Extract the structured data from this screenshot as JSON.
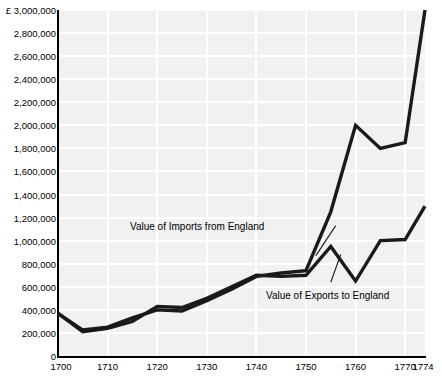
{
  "chart_data": {
    "type": "line",
    "title": "",
    "xlabel": "",
    "ylabel": "",
    "currency_symbol": "£",
    "grid": true,
    "legend_position": "inline-annotations",
    "xlim": [
      1700,
      1774
    ],
    "ylim": [
      0,
      3000000
    ],
    "y_ticks": [
      0,
      200000,
      400000,
      600000,
      800000,
      1000000,
      1200000,
      1400000,
      1600000,
      1800000,
      2000000,
      2200000,
      2400000,
      2600000,
      2800000,
      3000000
    ],
    "y_tick_labels": [
      "0",
      "200,000",
      "400,000",
      "600,000",
      "800,000",
      "1,000,000",
      "1,200,000",
      "1,400,000",
      "1,600,000",
      "1,800,000",
      "2,000,000",
      "2,200,000",
      "2,400,000",
      "2,600,000",
      "2,800,000",
      "£ 3,000,000"
    ],
    "x_ticks": [
      1700,
      1710,
      1720,
      1730,
      1740,
      1750,
      1760,
      1770,
      1774
    ],
    "x_tick_labels": [
      "1700",
      "1710",
      "1720",
      "1730",
      "1740",
      "1750",
      "1760",
      "1770",
      "1774"
    ],
    "series": [
      {
        "name": "Value of Imports from England",
        "color": "#1a1a1a",
        "x": [
          1700,
          1705,
          1710,
          1715,
          1720,
          1725,
          1730,
          1735,
          1740,
          1745,
          1750,
          1755,
          1760,
          1765,
          1770,
          1774
        ],
        "values": [
          370000,
          225000,
          250000,
          330000,
          400000,
          390000,
          480000,
          580000,
          690000,
          720000,
          740000,
          1250000,
          2000000,
          1800000,
          1850000,
          3000000
        ]
      },
      {
        "name": "Value of Exports to England",
        "color": "#1a1a1a",
        "x": [
          1700,
          1705,
          1710,
          1715,
          1720,
          1725,
          1730,
          1735,
          1740,
          1745,
          1750,
          1755,
          1760,
          1765,
          1770,
          1774
        ],
        "values": [
          370000,
          210000,
          240000,
          300000,
          430000,
          420000,
          500000,
          600000,
          700000,
          690000,
          700000,
          950000,
          650000,
          1000000,
          1010000,
          1300000
        ]
      }
    ],
    "annotations": [
      {
        "label": "Value of Imports from England",
        "name": "annotation-imports",
        "leader_from": [
          1752,
          870000
        ],
        "leader_to": [
          1756,
          1130000
        ]
      },
      {
        "label": "Value of Exports to England",
        "name": "annotation-exports",
        "leader_from": [
          1755,
          640000
        ],
        "leader_to": [
          1757,
          880000
        ]
      }
    ]
  }
}
